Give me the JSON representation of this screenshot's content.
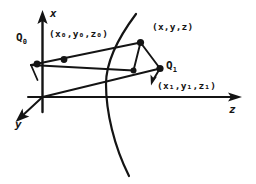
{
  "figure": {
    "type": "geometric-diagram",
    "ink_color": "#141414",
    "background_color": "#ffffff",
    "axes": [
      {
        "id": "x",
        "label": "x",
        "direction": "up"
      },
      {
        "id": "y",
        "label": "y",
        "direction": "down-left"
      },
      {
        "id": "z",
        "label": "z",
        "direction": "right"
      }
    ],
    "points": [
      {
        "id": "Q0",
        "label": "Q",
        "subscript": "0"
      },
      {
        "id": "Q1",
        "label": "Q",
        "subscript": "1"
      }
    ],
    "coordinate_labels": [
      {
        "id": "p0",
        "text": "(x₀,y₀,z₀)"
      },
      {
        "id": "p",
        "text": "(x,y,z)"
      },
      {
        "id": "p1",
        "text": "(x₁,y₁,z₁)"
      }
    ]
  }
}
